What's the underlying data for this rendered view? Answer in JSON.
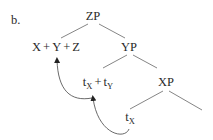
{
  "example_label": "b.",
  "tree": {
    "root": "ZP",
    "nodes": {
      "zp": "ZP",
      "complex_head": {
        "x": "X",
        "plus1": "+",
        "y": "Y",
        "plus2": "+",
        "z": "Z"
      },
      "yp": "YP",
      "trace_complex": {
        "t1": "t",
        "t1_sub": "X",
        "plus": "+",
        "t2": "t",
        "t2_sub": "Y"
      },
      "xp": "XP",
      "trace_x": {
        "t": "t",
        "sub": "X"
      }
    },
    "edges": [
      [
        "ZP",
        "X + Y + Z"
      ],
      [
        "ZP",
        "YP"
      ],
      [
        "YP",
        "tX + tY"
      ],
      [
        "YP",
        "XP"
      ],
      [
        "XP",
        "tX"
      ],
      [
        "XP",
        "(empty)"
      ]
    ],
    "movement_arrows": [
      {
        "from": "tX",
        "to": "tX + tY"
      },
      {
        "from": "tX + tY",
        "to": "X + Y + Z"
      }
    ]
  },
  "colors": {
    "text": "#2a2a2a",
    "lines": "#777777",
    "background": "#ffffff"
  }
}
